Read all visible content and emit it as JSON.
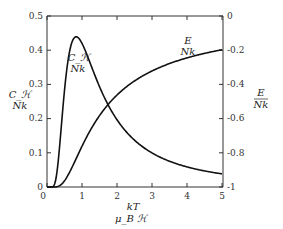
{
  "chart_data": {
    "type": "line",
    "title": "",
    "xlabel": "kT / (μ_B ℋ)",
    "xlabel_num": "kT",
    "xlabel_den": "μ_B ℋ",
    "ylabel_left_num": "C_ℋ",
    "ylabel_left_den": "Nk",
    "ylabel_right_num": "E",
    "ylabel_right_den": "Nk",
    "x_ticks": [
      "0",
      "1",
      "2",
      "3",
      "4",
      "5"
    ],
    "y_left_ticks": [
      "0",
      "0.1",
      "0.2",
      "0.3",
      "0.4",
      "0.5"
    ],
    "y_right_ticks": [
      "0",
      "-0.2",
      "-0.4",
      "-0.6",
      "-0.8",
      "-1"
    ],
    "xlim": [
      0,
      5
    ],
    "ylim_left": [
      0,
      0.5
    ],
    "ylim_right": [
      -1,
      0
    ],
    "grid": false,
    "legend": "none (inline curve labels)",
    "series": [
      {
        "name": "C_ℋ/Nk",
        "axis": "left",
        "curve_label_num": "C_ℋ",
        "curve_label_den": "Nk",
        "x": [
          0,
          0.2,
          0.3,
          0.4,
          0.5,
          0.6,
          0.7,
          0.8,
          0.9,
          1.0,
          1.2,
          1.4,
          1.6,
          1.8,
          2.0,
          2.5,
          3.0,
          3.5,
          4.0,
          4.5,
          5.0
        ],
        "values": [
          0,
          0.002,
          0.04,
          0.11,
          0.28,
          0.36,
          0.41,
          0.44,
          0.43,
          0.42,
          0.37,
          0.31,
          0.26,
          0.22,
          0.18,
          0.12,
          0.09,
          0.07,
          0.05,
          0.04,
          0.04
        ]
      },
      {
        "name": "E/Nk",
        "axis": "right",
        "curve_label_num": "E",
        "curve_label_den": "Nk",
        "x": [
          0,
          0.2,
          0.4,
          0.6,
          0.8,
          1.0,
          1.5,
          2.0,
          2.5,
          3.0,
          3.5,
          4.0,
          4.5,
          5.0
        ],
        "values": [
          -1.0,
          -1.0,
          -0.99,
          -0.93,
          -0.85,
          -0.76,
          -0.58,
          -0.46,
          -0.38,
          -0.32,
          -0.28,
          -0.24,
          -0.22,
          -0.2
        ]
      }
    ]
  }
}
